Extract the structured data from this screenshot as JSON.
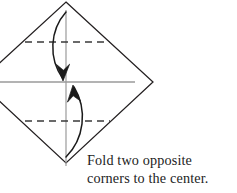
{
  "figure": {
    "caption": {
      "line1": "Fold two opposite",
      "line2": "corners to the center."
    },
    "colors": {
      "paper_outline": "#231f20",
      "center_guide_line": "#9a9a9a",
      "fold_crease_dashed": "#3a3a3a",
      "arrow": "#1a1a1a",
      "background": "#ffffff",
      "caption_text": "#1c1c1c"
    },
    "shapes": {
      "paper": {
        "name": "square-rotated-diamond",
        "vertices": [
          {
            "label": "top",
            "x": 66,
            "y": 2
          },
          {
            "label": "right",
            "x": 153,
            "y": 82
          },
          {
            "label": "bottom",
            "x": 66,
            "y": 163
          },
          {
            "label": "left",
            "x": -21,
            "y": 82
          }
        ]
      },
      "center_lines": [
        {
          "label": "horizontal-center-guide",
          "x1": 0,
          "y1": 82,
          "x2": 135,
          "y2": 82
        },
        {
          "label": "vertical-center-guide",
          "x1": 66,
          "y1": 10,
          "x2": 66,
          "y2": 166
        }
      ],
      "crease_lines": [
        {
          "label": "top-crease",
          "x1": 25,
          "y1": 42,
          "x2": 110,
          "y2": 42,
          "style": "dashed"
        },
        {
          "label": "bottom-crease",
          "x1": 25,
          "y1": 121,
          "x2": 110,
          "y2": 121,
          "style": "dashed"
        }
      ],
      "arrows": [
        {
          "label": "top-corner-fold-down-arrow",
          "direction": "down",
          "from": {
            "x": 66,
            "y": 12
          },
          "to": {
            "x": 65,
            "y": 82
          }
        },
        {
          "label": "bottom-corner-fold-up-arrow",
          "direction": "up",
          "from": {
            "x": 66,
            "y": 158
          },
          "to": {
            "x": 73,
            "y": 84
          }
        }
      ]
    }
  }
}
